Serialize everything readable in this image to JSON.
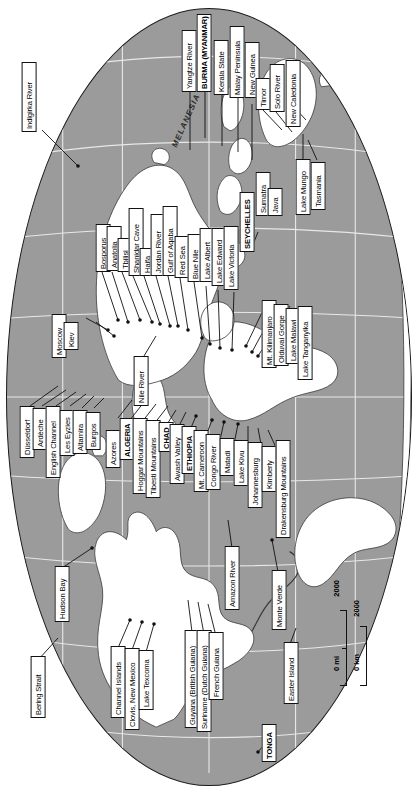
{
  "map": {
    "title": "World map of archaeological and geographic place labels",
    "projection": "oval",
    "orientation": "rotated 90 degrees clockwise",
    "colors": {
      "ocean": "#9b9b9b",
      "land": "#ffffff",
      "outline": "#1a1a1a",
      "label_background": "#ffffff",
      "label_text": "#000000",
      "leader_line": "#111111"
    },
    "scale_bar": {
      "miles_zero": "0 mi",
      "miles_max": "2000",
      "km_zero": "0 km",
      "km_max": "2000"
    },
    "regions": [
      {
        "name": "MELANESIA"
      },
      {
        "name": "POLYNESIA"
      }
    ],
    "labels": [
      {
        "text": "Indigirka River"
      },
      {
        "text": "Yangtze River"
      },
      {
        "text": "BURMA (MYANMAR)"
      },
      {
        "text": "Kerala State"
      },
      {
        "text": "Malay Peninsula"
      },
      {
        "text": "New Guinea"
      },
      {
        "text": "Timor"
      },
      {
        "text": "Solo River"
      },
      {
        "text": "New Caledonia"
      },
      {
        "text": "Lake Mungo"
      },
      {
        "text": "Tasmania"
      },
      {
        "text": "Bosporus"
      },
      {
        "text": "Anatolia"
      },
      {
        "text": "Tbilisi"
      },
      {
        "text": "Shanidar Cave"
      },
      {
        "text": "Haifa"
      },
      {
        "text": "Jordan River"
      },
      {
        "text": "Gulf of Aqaba"
      },
      {
        "text": "Red Sea"
      },
      {
        "text": "Blue Nile"
      },
      {
        "text": "Lake Albert"
      },
      {
        "text": "Lake Edward"
      },
      {
        "text": "Lake Victoria"
      },
      {
        "text": "SEYCHELLES"
      },
      {
        "text": "Sumatra"
      },
      {
        "text": "Java"
      },
      {
        "text": "Moscow"
      },
      {
        "text": "Kiev"
      },
      {
        "text": "Nile River"
      },
      {
        "text": "Mt. Kilimanjaro"
      },
      {
        "text": "Olduvai Gorge"
      },
      {
        "text": "Lake Malawi"
      },
      {
        "text": "Lake Tanganyika"
      },
      {
        "text": "Düsseldorf"
      },
      {
        "text": "Ardèche"
      },
      {
        "text": "English Channel"
      },
      {
        "text": "Les Eyzies"
      },
      {
        "text": "Altamira"
      },
      {
        "text": "Burgos"
      },
      {
        "text": "Azores"
      },
      {
        "text": "ALGERIA"
      },
      {
        "text": "Hoggar Mountains"
      },
      {
        "text": "Tibesti Mountains"
      },
      {
        "text": "CHAD"
      },
      {
        "text": "Awash Valley"
      },
      {
        "text": "ETHIOPIA"
      },
      {
        "text": "Mt. Cameroon"
      },
      {
        "text": "Congo River"
      },
      {
        "text": "Matadi"
      },
      {
        "text": "Lake Kivu"
      },
      {
        "text": "Johannesburg"
      },
      {
        "text": "Kimberly"
      },
      {
        "text": "Drakensburg Mountains"
      },
      {
        "text": "Hudson Bay"
      },
      {
        "text": "Bering Strait"
      },
      {
        "text": "Channel Islands"
      },
      {
        "text": "Clovis, New Mexico"
      },
      {
        "text": "Lake Texcoma"
      },
      {
        "text": "Guyana (British Guiana)"
      },
      {
        "text": "Suriname (Dutch Guiana)"
      },
      {
        "text": "French Guiana"
      },
      {
        "text": "Amazon River"
      },
      {
        "text": "Monte Verde"
      },
      {
        "text": "Easter Island"
      },
      {
        "text": "TONGA"
      }
    ]
  }
}
